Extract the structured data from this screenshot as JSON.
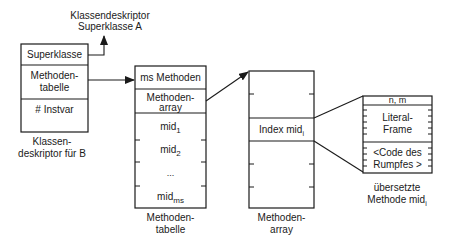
{
  "top_label": {
    "line1": "Klassendeskriptor",
    "line2": "Superklasse A"
  },
  "class_descriptor": {
    "rows": {
      "superklasse": "Superklasse",
      "methodentabelle_1": "Methoden-",
      "methodentabelle_2": "tabelle",
      "instvar": "# Instvar"
    },
    "caption": {
      "line1": "Klassen-",
      "line2": "deskriptor für B"
    }
  },
  "method_table": {
    "rows": {
      "count": "ms Methoden",
      "array_1": "Methoden-",
      "array_2": "array",
      "mid1": "mid",
      "mid1_sub": "1",
      "mid2": "mid",
      "mid2_sub": "2",
      "ellipsis": "...",
      "midms": "mid",
      "midms_sub": "ms"
    },
    "caption": {
      "line1": "Methoden-",
      "line2": "tabelle"
    }
  },
  "method_array": {
    "rows": {
      "index": "Index mid",
      "index_sub": "i"
    },
    "caption": {
      "line1": "Methoden-",
      "line2": "array"
    }
  },
  "compiled_method": {
    "rows": {
      "header": "n, m",
      "literal_1": "Literal-",
      "literal_2": "Frame",
      "code_1": "<Code des",
      "code_2": "Rumpfes >"
    },
    "caption": {
      "line1": "übersetzte",
      "line2": "Methode mid",
      "line2_sub": "i"
    }
  }
}
